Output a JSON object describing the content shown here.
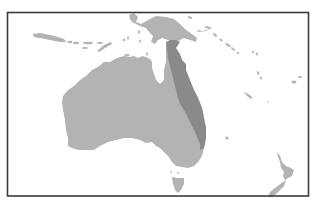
{
  "map": {
    "region": "Australia and Oceania",
    "frame": {
      "stroke": "#3a3a3a"
    },
    "colors": {
      "water": "#ffffff",
      "land": "#b3b3b3",
      "highlighted_region": "#8a8a8a"
    },
    "features": [
      {
        "id": "australia-mainland",
        "label": "Australia"
      },
      {
        "id": "highlighted-region",
        "label": "Eastern Queensland (highlighted)"
      },
      {
        "id": "new-guinea",
        "label": "New Guinea"
      },
      {
        "id": "tasmania",
        "label": "Tasmania"
      },
      {
        "id": "new-zealand",
        "label": "New Zealand"
      },
      {
        "id": "lesser-sunda-islands",
        "label": "Lesser Sunda Islands"
      },
      {
        "id": "pacific-islands",
        "label": "Pacific Islands"
      }
    ]
  }
}
